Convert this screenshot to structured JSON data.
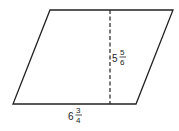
{
  "diagram": {
    "shape": "parallelogram",
    "vertices": {
      "top_left": [
        50,
        10
      ],
      "top_right": [
        173,
        10
      ],
      "bottom_right": [
        136,
        104
      ],
      "bottom_left": [
        13,
        104
      ]
    },
    "height_line": {
      "x": 110,
      "y1": 10,
      "y2": 104,
      "style": "dashed"
    },
    "height_label": {
      "whole": "5",
      "numerator": "5",
      "denominator": "6"
    },
    "base_label": {
      "whole": "6",
      "numerator": "3",
      "denominator": "4"
    },
    "stroke_color": "#222222"
  }
}
